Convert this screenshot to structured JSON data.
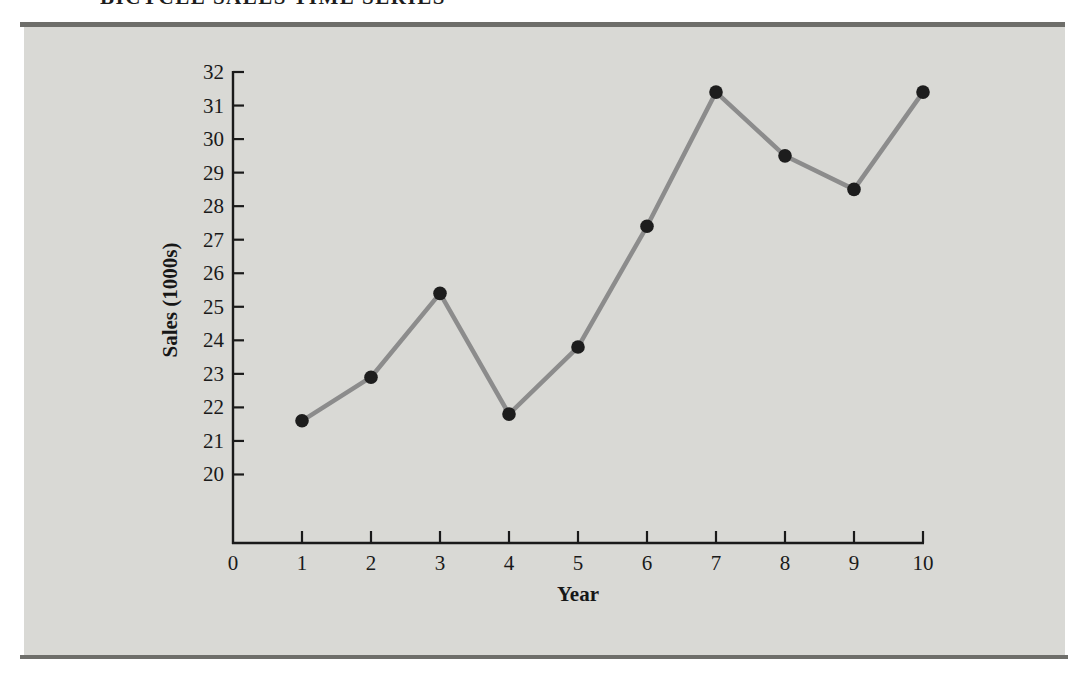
{
  "page": {
    "title_fragment": "BICYCLE SALES TIME SERIES",
    "panel_color": "#d9d9d5",
    "rule_color": "#6e6e6a",
    "background": "#ffffff"
  },
  "chart_data": {
    "type": "line",
    "title": "BICYCLE SALES TIME SERIES",
    "xlabel": "Year",
    "ylabel": "Sales (1000s)",
    "x": [
      1,
      2,
      3,
      4,
      5,
      6,
      7,
      8,
      9,
      10
    ],
    "series": [
      {
        "name": "Sales (1000s)",
        "values": [
          21.6,
          22.9,
          25.4,
          21.8,
          23.8,
          27.4,
          31.4,
          29.5,
          28.5,
          31.4
        ]
      }
    ],
    "xticks": [
      0,
      1,
      2,
      3,
      4,
      5,
      6,
      7,
      8,
      9,
      10
    ],
    "yticks": [
      20,
      21,
      22,
      23,
      24,
      25,
      26,
      27,
      28,
      29,
      30,
      31,
      32
    ],
    "xlim": [
      0,
      10
    ],
    "ylim": [
      18,
      32
    ],
    "grid": false,
    "legend": "none",
    "line_color": "#8c8c8c",
    "marker_color": "#1d1d1d",
    "axis_color": "#1a1a1a",
    "tick_label_color": "#1a1a1a"
  }
}
